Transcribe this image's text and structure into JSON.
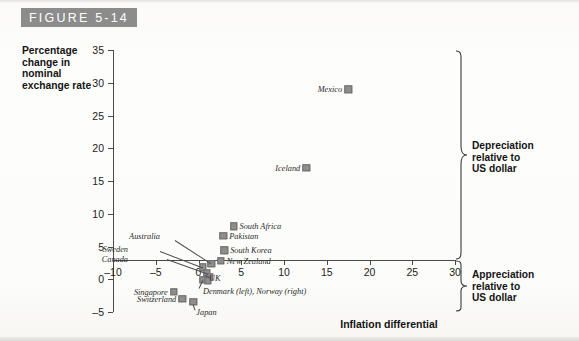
{
  "figure": {
    "banner_label": "FIGURE 5-14"
  },
  "axes": {
    "y_title": "Percentage change in nominal exchange rate",
    "x_title": "Inflation differential",
    "y_ticks": [
      35,
      30,
      25,
      20,
      15,
      10,
      5,
      0,
      -5
    ],
    "y_tick_labels": [
      "35",
      "30",
      "25",
      "20",
      "15",
      "10",
      "5",
      "0",
      "–5"
    ],
    "x_ticks": [
      -10,
      -5,
      0,
      5,
      10,
      15,
      20,
      25,
      30
    ],
    "x_tick_labels": [
      "–10",
      "–5",
      "0",
      "5",
      "10",
      "15",
      "20",
      "25",
      "30"
    ]
  },
  "annotations": {
    "depreciation": "Depreciation relative to US dollar",
    "depreciation_lines": [
      "Depreciation",
      "relative to",
      "US dollar"
    ],
    "appreciation": "Appreciation relative to US dollar",
    "appreciation_lines": [
      "Appreciation",
      "relative to",
      "US dollar"
    ],
    "combo_label": "Denmark (left), Norway (right)"
  },
  "colors": {
    "banner_bg": "#8c8c8c",
    "banner_text": "#ffffff",
    "marker": "#8e8e8e",
    "axis": "#4a4a4a",
    "page_bg": "#fdfdfb",
    "text": "#141414"
  },
  "chart_data": {
    "type": "scatter",
    "title": "FIGURE 5-14",
    "xlabel": "Inflation differential",
    "ylabel": "Percentage change in nominal exchange rate",
    "xlim": [
      -10,
      30
    ],
    "ylim": [
      -5,
      35
    ],
    "grid": false,
    "legend": null,
    "points": [
      {
        "name": "Mexico",
        "x": 17.5,
        "y": 29.0,
        "label_side": "left"
      },
      {
        "name": "Iceland",
        "x": 12.6,
        "y": 17.0,
        "label_side": "left"
      },
      {
        "name": "South Africa",
        "x": 4.1,
        "y": 8.1,
        "label_side": "right"
      },
      {
        "name": "Pakistan",
        "x": 2.9,
        "y": 6.6,
        "label_side": "right"
      },
      {
        "name": "South Korea",
        "x": 3.0,
        "y": 4.4,
        "label_side": "right"
      },
      {
        "name": "New Zealand",
        "x": 2.6,
        "y": 2.8,
        "label_side": "right"
      },
      {
        "name": "Australia",
        "x": 1.5,
        "y": 2.4,
        "label_side": "leader-up"
      },
      {
        "name": "Sweden",
        "x": 0.5,
        "y": 1.8,
        "label_side": "leader-left"
      },
      {
        "name": "Canada",
        "x": 1.0,
        "y": 0.9,
        "label_side": "leader-left"
      },
      {
        "name": "UK",
        "x": 1.3,
        "y": 0.4,
        "label_side": "leader-down"
      },
      {
        "name": "Denmark",
        "x": 0.5,
        "y": -0.1,
        "label_side": "leader-down"
      },
      {
        "name": "Norway",
        "x": 1.1,
        "y": -0.2,
        "label_side": "leader-down"
      },
      {
        "name": "Singapore",
        "x": -2.9,
        "y": -1.9,
        "label_side": "left"
      },
      {
        "name": "Switzerland",
        "x": -1.9,
        "y": -3.0,
        "label_side": "left"
      },
      {
        "name": "Japan",
        "x": -0.6,
        "y": -3.4,
        "label_side": "leader-down"
      }
    ]
  }
}
